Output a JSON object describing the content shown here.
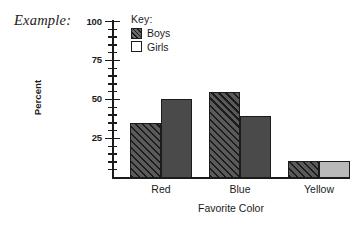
{
  "caption": "Example:",
  "legend": {
    "title": "Key:",
    "entries": [
      {
        "label": "Boys",
        "swatch": "hatched-swatch"
      },
      {
        "label": "Girls",
        "swatch": "outline-swatch"
      }
    ]
  },
  "chart_data": {
    "type": "bar",
    "title": "",
    "xlabel": "Favorite Color",
    "ylabel": "Percent",
    "categories": [
      "Red",
      "Blue",
      "Yellow"
    ],
    "series": [
      {
        "name": "Boys",
        "values": [
          35,
          55,
          11
        ],
        "fill": "diagonal-hatch",
        "color": "#5a5a5a"
      },
      {
        "name": "Girls",
        "values": [
          51,
          40,
          11
        ],
        "fill": "solid",
        "color": "#4a4a4a"
      }
    ],
    "ylim": [
      0,
      100
    ],
    "yticks": [
      25,
      50,
      75,
      100
    ],
    "ytick_labels": [
      "25",
      "50",
      "75",
      "100"
    ],
    "minor_tick_step": 5,
    "grid": false,
    "legend_position": "top-left-inside",
    "bar_colors": {
      "boys_all": "#5a5a5a",
      "girls_red": "#4a4a4a",
      "girls_blue": "#4a4a4a",
      "girls_yellow": "#b9b9b9",
      "outline": "#1b1b1b"
    }
  }
}
